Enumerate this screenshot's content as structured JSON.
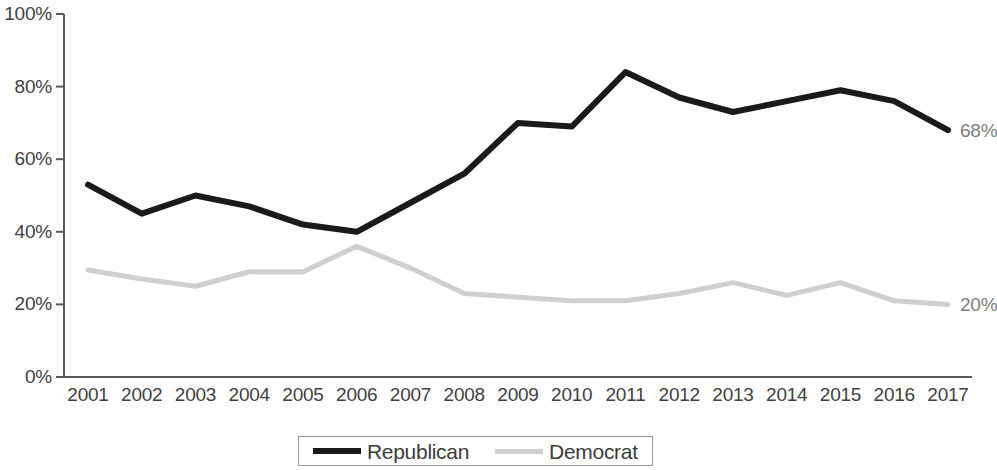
{
  "chart_data": {
    "type": "line",
    "title": "",
    "subtitle": "",
    "xlabel": "",
    "ylabel": "",
    "ylim": [
      0,
      100
    ],
    "yticks": [
      0,
      20,
      40,
      60,
      80,
      100
    ],
    "ytick_labels": [
      "0%",
      "20%",
      "40%",
      "60%",
      "80%",
      "100%"
    ],
    "grid": false,
    "legend_position": "bottom-center",
    "categories": [
      "2001",
      "2002",
      "2003",
      "2004",
      "2005",
      "2006",
      "2007",
      "2008",
      "2009",
      "2010",
      "2011",
      "2012",
      "2013",
      "2014",
      "2015",
      "2016",
      "2017"
    ],
    "series": [
      {
        "name": "Republican",
        "color": "#1a1a1a",
        "values": [
          53,
          45,
          50,
          47,
          42,
          40,
          48,
          56,
          70,
          69,
          84,
          77,
          73,
          76,
          79,
          76,
          68
        ],
        "end_label": "68%"
      },
      {
        "name": "Democrat",
        "color": "#cfcfcf",
        "values": [
          29.5,
          27,
          25,
          29,
          29,
          36,
          30,
          23,
          22,
          21,
          21,
          23,
          26,
          22.5,
          26,
          21,
          20
        ],
        "end_label": "20%"
      }
    ],
    "annotations": [
      {
        "series": "Republican",
        "category": "2017",
        "text": "68%"
      },
      {
        "series": "Democrat",
        "category": "2017",
        "text": "20%"
      }
    ]
  },
  "axes": {
    "y_tick_labels": [
      "100%",
      "80%",
      "60%",
      "40%",
      "20%",
      "0%"
    ],
    "x_tick_labels": [
      "2001",
      "2002",
      "2003",
      "2004",
      "2005",
      "2006",
      "2007",
      "2008",
      "2009",
      "2010",
      "2011",
      "2012",
      "2013",
      "2014",
      "2015",
      "2016",
      "2017"
    ]
  },
  "legend": {
    "entries": [
      {
        "label": "Republican",
        "color": "#1a1a1a"
      },
      {
        "label": "Democrat",
        "color": "#cfcfcf"
      }
    ]
  },
  "labels": {
    "republican_end": "68%",
    "democrat_end": "20%"
  }
}
